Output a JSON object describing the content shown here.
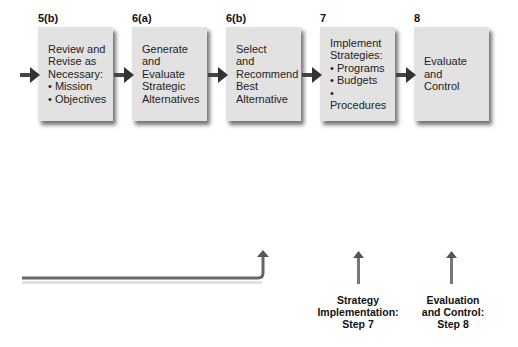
{
  "diagram": {
    "steps": [
      {
        "number": "5(b)",
        "text": "Review and\nRevise as\nNecessary:\n• Mission\n• Objectives"
      },
      {
        "number": "6(a)",
        "text": "Generate\nand\nEvaluate\nStrategic\nAlternatives"
      },
      {
        "number": "6(b)",
        "text": "Select\nand\nRecommend\nBest\nAlternative"
      },
      {
        "number": "7",
        "text": "Implement\nStrategies:\n• Programs\n• Budgets\n• Procedures"
      },
      {
        "number": "8",
        "text": "Evaluate\nand\nControl"
      }
    ],
    "captions": [
      {
        "text": "Strategy\nImplementation:\nStep 7"
      },
      {
        "text": "Evaluation\nand Control:\nStep 8"
      }
    ],
    "colors": {
      "box_fill": "#e2e2e2",
      "arrow": "#555555"
    }
  }
}
